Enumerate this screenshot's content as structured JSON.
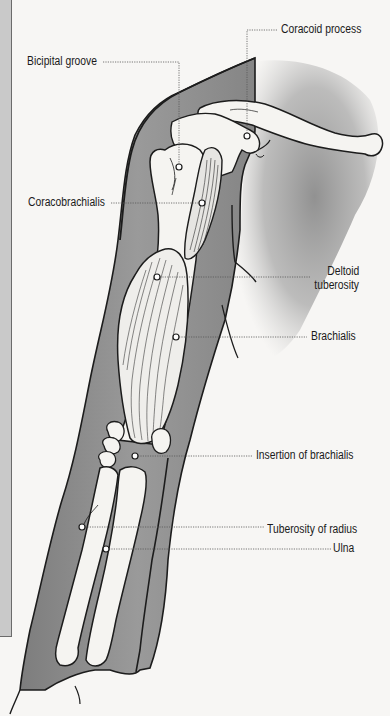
{
  "figure": {
    "type": "anatomical-illustration",
    "colors": {
      "background": "#f7f6f4",
      "skin_shade": "#8f8f8f",
      "bone_fill": "#f5f4f1",
      "outline": "#1c1c1c",
      "leader_line": "#555555",
      "side_panel": "#c9c9c9"
    },
    "labels": [
      {
        "id": "bicipital-groove",
        "text": "Bicipital groove",
        "marker": [
          179,
          167
        ]
      },
      {
        "id": "coracoid-process",
        "text": "Coracoid process",
        "marker": [
          247,
          136
        ]
      },
      {
        "id": "coracobrachialis",
        "text": "Coracobrachialis",
        "marker": [
          202,
          203
        ]
      },
      {
        "id": "deltoid-tuberosity",
        "text_line1": "Deltoid",
        "text_line2": "tuberosity",
        "marker": [
          157,
          277
        ]
      },
      {
        "id": "brachialis",
        "text": "Brachialis",
        "marker": [
          176,
          337
        ]
      },
      {
        "id": "insertion-of-brachialis",
        "text": "Insertion of brachialis",
        "marker": [
          135,
          456
        ]
      },
      {
        "id": "tuberosity-of-radius",
        "text": "Tuberosity of radius",
        "marker": [
          82,
          527
        ]
      },
      {
        "id": "ulna",
        "text": "Ulna",
        "marker": [
          106,
          549
        ]
      }
    ]
  }
}
